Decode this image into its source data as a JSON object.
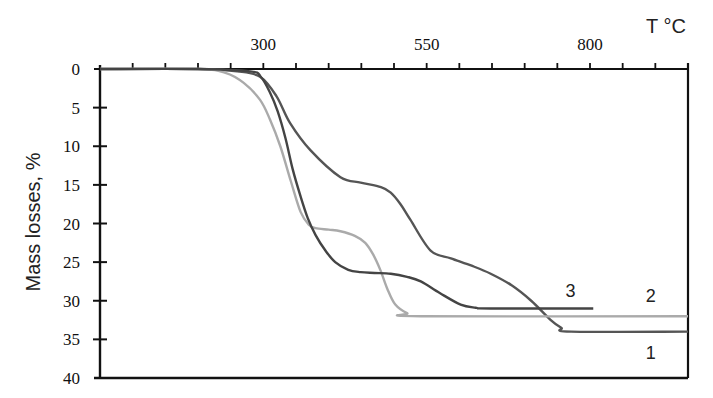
{
  "chart_data": {
    "type": "line",
    "title": "",
    "xlabel": "T °C",
    "ylabel": "Mass losses, %",
    "x_axis_position": "top",
    "y_axis_inverted": true,
    "xlim": [
      50,
      950
    ],
    "ylim": [
      0,
      40
    ],
    "x_ticks": {
      "labels": [
        "300",
        "550",
        "800"
      ],
      "label_values": [
        300,
        550,
        800
      ],
      "minor_step": 50
    },
    "y_ticks": [
      "0",
      "5",
      "10",
      "15",
      "20",
      "25",
      "30",
      "35",
      "40"
    ],
    "grid": false,
    "legend": "inline labels 1, 2, 3 near curve ends",
    "series": [
      {
        "name": "1",
        "color": "#555555",
        "points": [
          [
            50,
            0
          ],
          [
            200,
            0
          ],
          [
            260,
            0.3
          ],
          [
            295,
            1
          ],
          [
            320,
            3.5
          ],
          [
            341,
            7
          ],
          [
            372,
            10.5
          ],
          [
            418,
            14
          ],
          [
            449,
            14.7
          ],
          [
            480,
            15.3
          ],
          [
            495,
            16
          ],
          [
            510,
            17.5
          ],
          [
            525,
            19.5
          ],
          [
            556,
            23.5
          ],
          [
            587,
            24.5
          ],
          [
            620,
            25.5
          ],
          [
            648,
            26.5
          ],
          [
            680,
            28
          ],
          [
            710,
            30
          ],
          [
            740,
            32.5
          ],
          [
            756,
            33.5
          ],
          [
            771,
            34
          ],
          [
            950,
            34
          ]
        ]
      },
      {
        "name": "2",
        "color": "#aaaaaa",
        "points": [
          [
            50,
            0
          ],
          [
            200,
            0
          ],
          [
            242,
            0.5
          ],
          [
            270,
            1.8
          ],
          [
            295,
            4
          ],
          [
            310,
            6.5
          ],
          [
            326,
            10
          ],
          [
            342,
            14.5
          ],
          [
            357,
            18.5
          ],
          [
            370,
            20.2
          ],
          [
            380,
            20.6
          ],
          [
            400,
            20.8
          ],
          [
            418,
            21
          ],
          [
            440,
            21.6
          ],
          [
            456,
            22.5
          ],
          [
            468,
            24
          ],
          [
            479,
            26
          ],
          [
            490,
            28.5
          ],
          [
            502,
            30.5
          ],
          [
            520,
            31.6
          ],
          [
            541,
            32
          ],
          [
            950,
            32
          ]
        ]
      },
      {
        "name": "3",
        "color": "#444444",
        "points": [
          [
            50,
            0
          ],
          [
            200,
            0
          ],
          [
            280,
            0.3
          ],
          [
            296,
            1
          ],
          [
            310,
            3
          ],
          [
            322,
            5.5
          ],
          [
            334,
            9
          ],
          [
            345,
            13
          ],
          [
            357,
            16.5
          ],
          [
            368,
            19.3
          ],
          [
            380,
            21.5
          ],
          [
            395,
            23.5
          ],
          [
            410,
            25
          ],
          [
            430,
            26
          ],
          [
            449,
            26.3
          ],
          [
            470,
            26.4
          ],
          [
            495,
            26.5
          ],
          [
            520,
            26.9
          ],
          [
            541,
            27.5
          ],
          [
            570,
            29
          ],
          [
            602,
            30.5
          ],
          [
            625,
            30.9
          ],
          [
            648,
            31
          ],
          [
            805,
            31
          ]
        ]
      }
    ],
    "annotations": [
      {
        "text": "3",
        "x": 770,
        "y": 29.5
      },
      {
        "text": "2",
        "x": 893,
        "y": 30.2
      },
      {
        "text": "1",
        "x": 893,
        "y": 37.5
      }
    ]
  }
}
